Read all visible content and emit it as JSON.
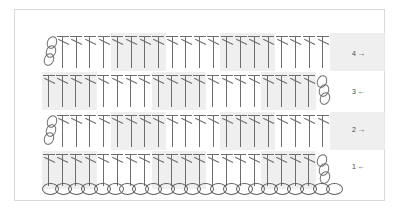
{
  "diagram": {
    "type": "crochet-pattern-chart",
    "stitch_symbols": {
      "double_crochet": "dc-symbol",
      "chain": "chain-oval-symbol"
    },
    "colors": {
      "stitch_line": "#6d6d6d",
      "shade_block": "#ececec",
      "frame_border": "#d8d8d8",
      "background": "#ffffff",
      "label_text": "#4a4a4a"
    },
    "foundation": {
      "name": "foundation-chain",
      "stitch": "chain",
      "count": 23
    },
    "rows": [
      {
        "number": "4",
        "arrow": "→",
        "direction": "right",
        "turning_chain_side": "left",
        "turning_chain_count": 3,
        "dc_count": 20,
        "shaded_blocks": [
          1,
          3,
          5
        ]
      },
      {
        "number": "3",
        "arrow": "←",
        "direction": "left",
        "turning_chain_side": "right",
        "turning_chain_count": 3,
        "dc_count": 20,
        "shaded_blocks": [
          0,
          2,
          4
        ]
      },
      {
        "number": "2",
        "arrow": "→",
        "direction": "right",
        "turning_chain_side": "left",
        "turning_chain_count": 3,
        "dc_count": 20,
        "shaded_blocks": [
          1,
          3,
          5
        ]
      },
      {
        "number": "1",
        "arrow": "←",
        "direction": "left",
        "turning_chain_side": "right",
        "turning_chain_count": 3,
        "dc_count": 20,
        "shaded_blocks": [
          0,
          2,
          4
        ]
      }
    ],
    "block_size": 4
  }
}
